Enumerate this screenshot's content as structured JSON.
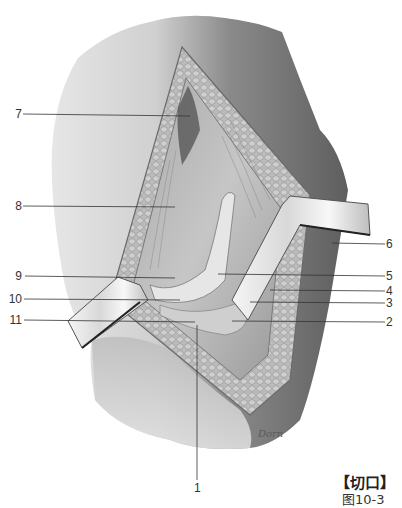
{
  "figure": {
    "caption": "【切口】",
    "figure_number_partial": "图10-3",
    "signature": "Dorn",
    "colors": {
      "background": "#ffffff",
      "skin_light": "#d9d9d9",
      "skin_dark": "#6e6e6e",
      "fat_layer": "#b8b8b8",
      "retractor": "#e8e8e8",
      "leader_line": "#333333"
    }
  },
  "labels": {
    "left": [
      {
        "id": "7",
        "text": "7"
      },
      {
        "id": "8",
        "text": "8"
      },
      {
        "id": "9",
        "text": "9"
      },
      {
        "id": "10",
        "text": "10"
      },
      {
        "id": "11",
        "text": "11"
      }
    ],
    "right": [
      {
        "id": "6",
        "text": "6"
      },
      {
        "id": "5",
        "text": "5"
      },
      {
        "id": "4",
        "text": "4"
      },
      {
        "id": "3",
        "text": "3"
      },
      {
        "id": "2",
        "text": "2"
      }
    ],
    "bottom": [
      {
        "id": "1",
        "text": "1"
      }
    ]
  }
}
